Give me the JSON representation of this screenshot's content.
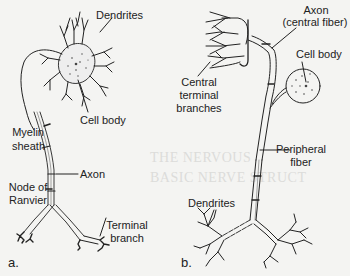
{
  "figure": {
    "panel_a": {
      "letter": "a.",
      "labels": {
        "dendrites": "Dendrites",
        "cell_body": "Cell body",
        "myelin_l1": "Myelin",
        "myelin_l2": "sheath",
        "axon": "Axon",
        "node_l1": "Node of",
        "node_l2": "Ranvier",
        "terminal_l1": "Terminal",
        "terminal_l2": "branch"
      }
    },
    "panel_b": {
      "letter": "b.",
      "labels": {
        "axon_l1": "Axon",
        "axon_l2": "(central fiber)",
        "cell_body": "Cell body",
        "central_l1": "Central",
        "central_l2": "terminal",
        "central_l3": "branches",
        "peripheral_l1": "Peripheral",
        "peripheral_l2": "fiber",
        "dendrites": "Dendrites"
      }
    },
    "bleed_through": {
      "heading_1": "THE NERVOUS",
      "heading_2": "BASIC NERVE STRUCT"
    },
    "colors": {
      "ink": "#222222",
      "paper": "#f4f4f2"
    }
  }
}
